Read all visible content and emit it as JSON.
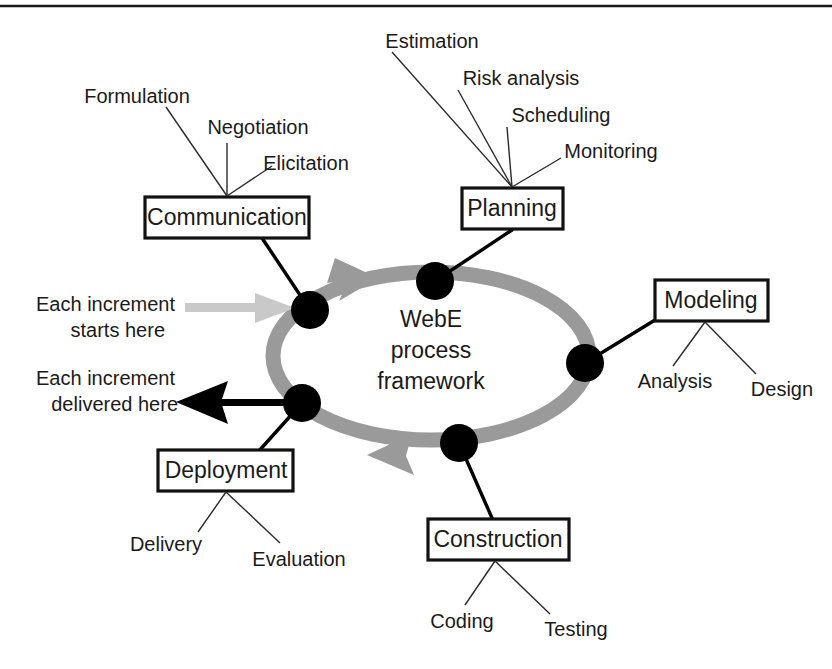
{
  "figure": {
    "center_label_lines": [
      "WebE",
      "process",
      "framework"
    ],
    "notes": [
      {
        "id": "entry",
        "lines": [
          "Each increment",
          "starts here"
        ]
      },
      {
        "id": "exit",
        "lines": [
          "Each increment",
          "delivered here"
        ]
      }
    ],
    "colors": {
      "ring": "#9a9a9a",
      "node": "#000000",
      "box_stroke": "#111111",
      "text": "#1a1a1a",
      "entry_arrow": "#c9c9c9",
      "exit_arrow": "#000000",
      "background": "#ffffff"
    },
    "activities": [
      {
        "id": "communication",
        "label": "Communication",
        "sub_activities": [
          "Formulation",
          "Negotiation",
          "Elicitation"
        ]
      },
      {
        "id": "planning",
        "label": "Planning",
        "sub_activities": [
          "Estimation",
          "Risk analysis",
          "Scheduling",
          "Monitoring"
        ]
      },
      {
        "id": "modeling",
        "label": "Modeling",
        "sub_activities": [
          "Analysis",
          "Design"
        ]
      },
      {
        "id": "construction",
        "label": "Construction",
        "sub_activities": [
          "Coding",
          "Testing"
        ]
      },
      {
        "id": "deployment",
        "label": "Deployment",
        "sub_activities": [
          "Delivery",
          "Evaluation"
        ]
      }
    ]
  }
}
